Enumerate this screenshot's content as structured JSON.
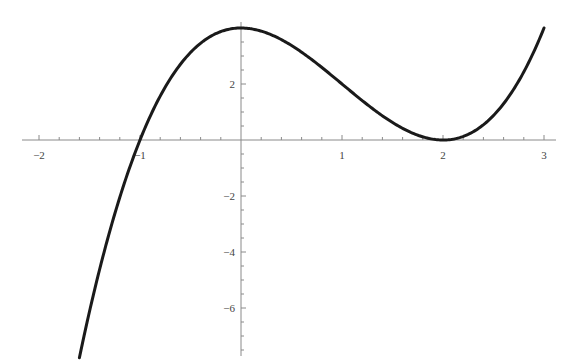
{
  "chart_data": {
    "type": "line",
    "title": "",
    "xlabel": "",
    "ylabel": "",
    "function": "f(x) = (x+1)(x-2)^2 = x^3 - 3x^2 + 4",
    "xlim": [
      -2.05,
      3.05
    ],
    "ylim": [
      -7.5,
      4.2
    ],
    "x_ticks": [
      -2,
      -1,
      1,
      2,
      3
    ],
    "x_tick_labels": [
      "-2",
      "-1",
      "1",
      "2",
      "3"
    ],
    "y_ticks": [
      4,
      2,
      -2,
      -4,
      -6
    ],
    "y_tick_labels": [
      "4",
      "2",
      "-2",
      "-4",
      "-6"
    ],
    "grid": false,
    "legend": null,
    "series": [
      {
        "name": "f(x)",
        "x": [
          -1.6,
          -1.4,
          -1.2,
          -1.0,
          -0.8,
          -0.6,
          -0.4,
          -0.2,
          0.0,
          0.2,
          0.4,
          0.6,
          0.8,
          1.0,
          1.2,
          1.4,
          1.6,
          1.8,
          2.0,
          2.2,
          2.4,
          2.6,
          2.8,
          3.0
        ],
        "values": [
          -7.5,
          -4.64,
          -2.37,
          0.0,
          0.29,
          1.66,
          2.78,
          3.87,
          4.0,
          3.89,
          3.58,
          3.14,
          2.59,
          2.0,
          1.41,
          0.86,
          0.42,
          0.12,
          0.0,
          0.11,
          0.54,
          1.3,
          2.43,
          4.0
        ]
      }
    ],
    "key_points": {
      "local_max": [
        0,
        4
      ],
      "local_min": [
        2,
        0
      ],
      "roots": [
        -1,
        2
      ],
      "y_intercept": 4
    }
  }
}
